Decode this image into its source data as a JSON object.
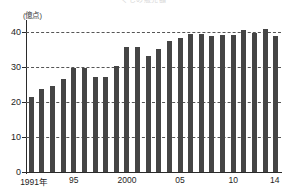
{
  "chart_data": {
    "type": "bar",
    "title": "くじの販売額",
    "unit_label": "(億点)",
    "xlabel": "",
    "ylabel": "億点",
    "ylim": [
      0,
      43
    ],
    "grid": true,
    "grid_style": "dashed horizontal",
    "legend": "none",
    "bar_color": "#454545",
    "axis_color": "#2b2b2b",
    "y_ticks": [
      {
        "value": 0,
        "label": "0"
      },
      {
        "value": 10,
        "label": "10"
      },
      {
        "value": 20,
        "label": "20"
      },
      {
        "value": 30,
        "label": "30"
      },
      {
        "value": 40,
        "label": "40"
      }
    ],
    "x_tick_labels": [
      {
        "category": "1991",
        "label": "1991年"
      },
      {
        "category": "1995",
        "label": "95"
      },
      {
        "category": "2000",
        "label": "2000"
      },
      {
        "category": "2005",
        "label": "05"
      },
      {
        "category": "2010",
        "label": "10"
      },
      {
        "category": "2014",
        "label": "14"
      }
    ],
    "categories": [
      "1991",
      "1992",
      "1993",
      "1994",
      "1995",
      "1996",
      "1997",
      "1998",
      "1999",
      "2000",
      "2001",
      "2002",
      "2003",
      "2004",
      "2005",
      "2006",
      "2007",
      "2008",
      "2009",
      "2010",
      "2011",
      "2012",
      "2013",
      "2014"
    ],
    "values": [
      21.5,
      23.7,
      24.8,
      26.7,
      29.9,
      29.9,
      27.1,
      27.1,
      30.4,
      35.8,
      35.7,
      33.3,
      35.4,
      37.5,
      38.3,
      39.6,
      39.5,
      38.9,
      39.4,
      39.2,
      40.6,
      39.9,
      41.0,
      38.9
    ]
  }
}
